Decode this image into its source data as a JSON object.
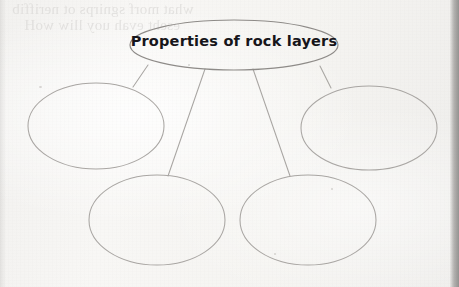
{
  "page": {
    "medium": "scanned-worksheet-page",
    "width": 459,
    "height": 287,
    "background_color": "#f6f5f3",
    "ink_color": "#a9a6a3",
    "text_color": "#16151a"
  },
  "bleed_through": {
    "description": "faint mirrored text showing through from the reverse side of the page",
    "line_1": "what morf sgnirps ot neriffib",
    "line_2": "eseht evah uoy lliw woH"
  },
  "concept_map": {
    "type": "concept-map-web",
    "center_node": {
      "label": "Properties of rock layers",
      "shape": "ellipse",
      "filled": false,
      "cx": 234,
      "cy": 45,
      "rx": 104,
      "ry": 25
    },
    "branch_nodes": [
      {
        "id": "branch-left",
        "label": "",
        "shape": "ellipse",
        "filled": false,
        "cx": 96,
        "cy": 126,
        "rx": 68,
        "ry": 43
      },
      {
        "id": "branch-right",
        "label": "",
        "shape": "ellipse",
        "filled": false,
        "cx": 369,
        "cy": 128,
        "rx": 68,
        "ry": 42
      },
      {
        "id": "branch-bottom-left",
        "label": "",
        "shape": "ellipse",
        "filled": false,
        "cx": 157,
        "cy": 220,
        "rx": 68,
        "ry": 45
      },
      {
        "id": "branch-bottom-right",
        "label": "",
        "shape": "ellipse",
        "filled": false,
        "cx": 308,
        "cy": 220,
        "rx": 68,
        "ry": 45
      }
    ],
    "connectors": [
      {
        "id": "connector-to-left",
        "from": [
          148,
          65
        ],
        "to": [
          133,
          87
        ]
      },
      {
        "id": "connector-to-right",
        "from": [
          320,
          66
        ],
        "to": [
          331,
          88
        ]
      },
      {
        "id": "connector-to-bottom-left",
        "from": [
          205,
          69
        ],
        "to": [
          168,
          176
        ]
      },
      {
        "id": "connector-to-bottom-right",
        "from": [
          253,
          69
        ],
        "to": [
          290,
          176
        ]
      }
    ]
  }
}
